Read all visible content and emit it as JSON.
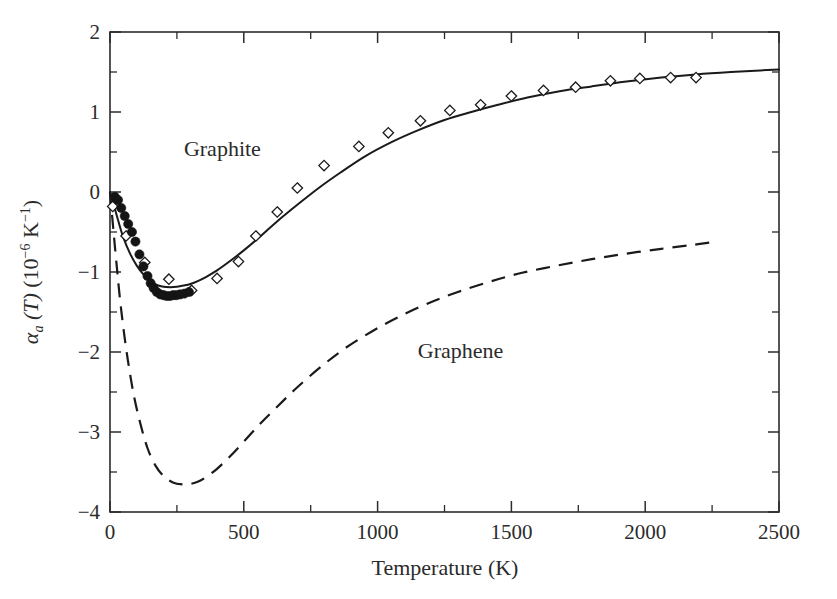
{
  "chart_data": {
    "type": "line",
    "title": "",
    "subtitle": "",
    "xlabel": "Temperature (K)",
    "ylabel_parts": {
      "alpha": "α",
      "alpha_sub": "a",
      "paren_T": "(T)",
      "units_prefix": " (10",
      "units_exp1": "−6",
      "units_mid": " K",
      "units_exp2": "−1",
      "units_suffix": ")"
    },
    "ylabel": "αa (T) (10−6 K−1)",
    "xlim": [
      0,
      2500
    ],
    "ylim": [
      -4,
      2
    ],
    "xticks": [
      0,
      500,
      1000,
      1500,
      2000,
      2500
    ],
    "xtick_labels": [
      "0",
      "500",
      "1000",
      "1500",
      "2000",
      "2500"
    ],
    "xminor_ticks": [
      250,
      750,
      1250,
      1750,
      2250
    ],
    "yticks": [
      2,
      1,
      0,
      -1,
      -2,
      -3,
      -4
    ],
    "ytick_labels": [
      "2",
      "1",
      "0",
      "−1",
      "−2",
      "−3",
      "−4"
    ],
    "yminor_ticks": [
      1.5,
      0.5,
      -0.5,
      -1.5,
      -2.5,
      -3.5
    ],
    "grid": false,
    "legend_position": "inline-annotations",
    "annotations": [
      {
        "text": "Graphite",
        "x": 420,
        "y": 0.45,
        "name": "graphite-label"
      },
      {
        "text": "Graphene",
        "x": 1310,
        "y": -2.08,
        "name": "graphene-label"
      }
    ],
    "series": [
      {
        "name": "Graphite (theory)",
        "style": "solid-line",
        "x": [
          0,
          15,
          30,
          50,
          75,
          100,
          125,
          150,
          175,
          200,
          225,
          250,
          275,
          300,
          330,
          360,
          400,
          450,
          500,
          560,
          620,
          700,
          780,
          860,
          950,
          1050,
          1150,
          1250,
          1350,
          1450,
          1560,
          1680,
          1800,
          1930,
          2060,
          2190,
          2320,
          2430,
          2500
        ],
        "y": [
          0.0,
          -0.17,
          -0.35,
          -0.57,
          -0.77,
          -0.92,
          -1.03,
          -1.11,
          -1.16,
          -1.185,
          -1.19,
          -1.185,
          -1.17,
          -1.15,
          -1.11,
          -1.06,
          -0.98,
          -0.86,
          -0.73,
          -0.56,
          -0.38,
          -0.16,
          0.05,
          0.24,
          0.44,
          0.62,
          0.77,
          0.9,
          1.0,
          1.09,
          1.18,
          1.26,
          1.32,
          1.38,
          1.43,
          1.47,
          1.5,
          1.52,
          1.53
        ]
      },
      {
        "name": "Graphene (theory)",
        "style": "dashed-line",
        "x": [
          0,
          12,
          25,
          40,
          60,
          85,
          110,
          140,
          170,
          200,
          235,
          270,
          300,
          330,
          360,
          400,
          450,
          500,
          560,
          620,
          700,
          790,
          880,
          980,
          1080,
          1190,
          1300,
          1420,
          1540,
          1670,
          1800,
          1930,
          2060,
          2180,
          2270
        ],
        "y": [
          0.0,
          -0.45,
          -0.92,
          -1.42,
          -1.95,
          -2.47,
          -2.85,
          -3.2,
          -3.42,
          -3.55,
          -3.63,
          -3.655,
          -3.65,
          -3.62,
          -3.56,
          -3.46,
          -3.3,
          -3.12,
          -2.9,
          -2.7,
          -2.44,
          -2.18,
          -1.95,
          -1.74,
          -1.56,
          -1.39,
          -1.25,
          -1.12,
          -1.01,
          -0.92,
          -0.84,
          -0.77,
          -0.71,
          -0.66,
          -0.62
        ]
      },
      {
        "name": "Graphite (experiment, open diamonds)",
        "style": "open-diamond-markers",
        "x": [
          10,
          60,
          130,
          220,
          305,
          400,
          480,
          545,
          625,
          700,
          800,
          930,
          1040,
          1160,
          1270,
          1385,
          1500,
          1620,
          1740,
          1870,
          1980,
          2095,
          2190
        ],
        "y": [
          -0.18,
          -0.55,
          -0.88,
          -1.09,
          -1.23,
          -1.08,
          -0.87,
          -0.55,
          -0.25,
          0.05,
          0.33,
          0.57,
          0.74,
          0.89,
          1.02,
          1.09,
          1.2,
          1.27,
          1.31,
          1.39,
          1.42,
          1.43,
          1.43
        ]
      },
      {
        "name": "Graphite (experiment, filled circles)",
        "style": "filled-circle-markers",
        "x": [
          18,
          30,
          42,
          55,
          68,
          82,
          95,
          110,
          125,
          140,
          152,
          163,
          175,
          188,
          200,
          212,
          224,
          236,
          248,
          262,
          278,
          295
        ],
        "y": [
          -0.06,
          -0.1,
          -0.2,
          -0.3,
          -0.4,
          -0.5,
          -0.62,
          -0.78,
          -0.93,
          -1.05,
          -1.14,
          -1.2,
          -1.25,
          -1.28,
          -1.29,
          -1.3,
          -1.3,
          -1.29,
          -1.29,
          -1.28,
          -1.27,
          -1.25
        ]
      }
    ]
  },
  "figure": {
    "background_color": "#ffffff",
    "foreground_color": "#1a1a1a"
  }
}
